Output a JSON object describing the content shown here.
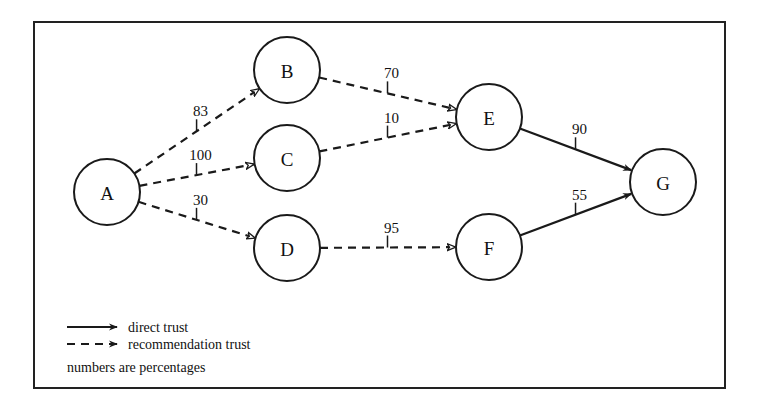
{
  "nodes": [
    {
      "id": "A",
      "label": "A",
      "x": 107,
      "y": 192
    },
    {
      "id": "B",
      "label": "B",
      "x": 287,
      "y": 70
    },
    {
      "id": "C",
      "label": "C",
      "x": 287,
      "y": 158
    },
    {
      "id": "D",
      "label": "D",
      "x": 287,
      "y": 248
    },
    {
      "id": "E",
      "label": "E",
      "x": 489,
      "y": 117
    },
    {
      "id": "F",
      "label": "F",
      "x": 489,
      "y": 247
    },
    {
      "id": "G",
      "label": "G",
      "x": 663,
      "y": 182
    }
  ],
  "edges": [
    {
      "from": "A",
      "to": "B",
      "weight": "83",
      "type": "recommendation"
    },
    {
      "from": "A",
      "to": "C",
      "weight": "100",
      "type": "recommendation"
    },
    {
      "from": "A",
      "to": "D",
      "weight": "30",
      "type": "recommendation"
    },
    {
      "from": "B",
      "to": "E",
      "weight": "70",
      "type": "recommendation"
    },
    {
      "from": "C",
      "to": "E",
      "weight": "10",
      "type": "recommendation"
    },
    {
      "from": "D",
      "to": "F",
      "weight": "95",
      "type": "recommendation"
    },
    {
      "from": "E",
      "to": "G",
      "weight": "90",
      "type": "direct"
    },
    {
      "from": "F",
      "to": "G",
      "weight": "55",
      "type": "direct"
    }
  ],
  "legend": {
    "direct": "direct trust",
    "recommendation": "recommendation trust",
    "note": "numbers are percentages"
  },
  "colors": {
    "stroke": "#1a1a1a",
    "background": "#ffffff"
  }
}
